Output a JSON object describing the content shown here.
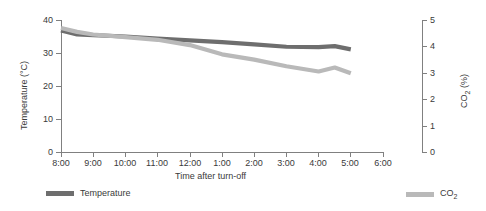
{
  "chart_data": {
    "type": "line",
    "title": "",
    "xlabel": "Time after turn-off",
    "ylabel": "Temperature (°C)",
    "y2label": "CO2 (%)",
    "grid": false,
    "legend_position": "bottom",
    "x": [
      "8:00",
      "9:00",
      "10:00",
      "11:00",
      "12:00",
      "1:00",
      "2:00",
      "3:00",
      "4:00",
      "5:00",
      "6:00"
    ],
    "xtick_labels": [
      "8:00",
      "9:00",
      "10:00",
      "11:00",
      "12:00",
      "1:00",
      "2:00",
      "3:00",
      "4:00",
      "5:00",
      "6:00"
    ],
    "ylim": [
      0,
      40
    ],
    "ytick_labels": [
      "0",
      "10",
      "20",
      "30",
      "40"
    ],
    "ytick_values": [
      0,
      10,
      20,
      30,
      40
    ],
    "y2lim": [
      0,
      5
    ],
    "y2tick_labels": [
      "0",
      "1",
      "2",
      "3",
      "4",
      "5"
    ],
    "y2tick_values": [
      0,
      1,
      2,
      3,
      4,
      5
    ],
    "series": [
      {
        "name": "Temperature",
        "axis": "left",
        "color": "#6e6e6e",
        "unit": "°C",
        "x": [
          "8:00",
          "8:30",
          "9:00",
          "10:00",
          "11:00",
          "12:00",
          "1:00",
          "2:00",
          "3:00",
          "4:00",
          "4:30",
          "5:00"
        ],
        "values": [
          36.8,
          35.6,
          35.4,
          35.0,
          34.4,
          33.8,
          33.3,
          32.6,
          31.9,
          31.8,
          32.1,
          31.1
        ]
      },
      {
        "name": "CO2",
        "axis": "right",
        "color": "#b9b9b9",
        "unit": "%",
        "x": [
          "8:00",
          "8:30",
          "9:00",
          "10:00",
          "11:00",
          "12:00",
          "1:00",
          "2:00",
          "3:00",
          "4:00",
          "4:30",
          "5:00"
        ],
        "values": [
          4.7,
          4.55,
          4.45,
          4.35,
          4.25,
          4.05,
          3.7,
          3.5,
          3.25,
          3.05,
          3.2,
          2.98
        ]
      }
    ]
  },
  "axes": {
    "x_title": "Time after turn-off",
    "y_left_title_pre": "Temperature (°C)",
    "y_right_title_main": "CO",
    "y_right_title_sub": "2",
    "y_right_title_post": " (%)",
    "x_ticks": [
      "8:00",
      "9:00",
      "10:00",
      "11:00",
      "12:00",
      "1:00",
      "2:00",
      "3:00",
      "4:00",
      "5:00",
      "6:00"
    ],
    "y_left_ticks": [
      "40",
      "30",
      "20",
      "10",
      "0"
    ],
    "y_right_ticks": [
      "5",
      "4",
      "3",
      "2",
      "1",
      "0"
    ]
  },
  "legend": {
    "items": [
      {
        "label": "Temperature",
        "label_sub": "",
        "color": "#6e6e6e"
      },
      {
        "label": "CO",
        "label_sub": "2",
        "color": "#b9b9b9"
      }
    ]
  },
  "colors": {
    "temperature": "#6e6e6e",
    "co2": "#b9b9b9",
    "axis": "#808080",
    "text": "#3a3a3a",
    "background": "#ffffff"
  }
}
